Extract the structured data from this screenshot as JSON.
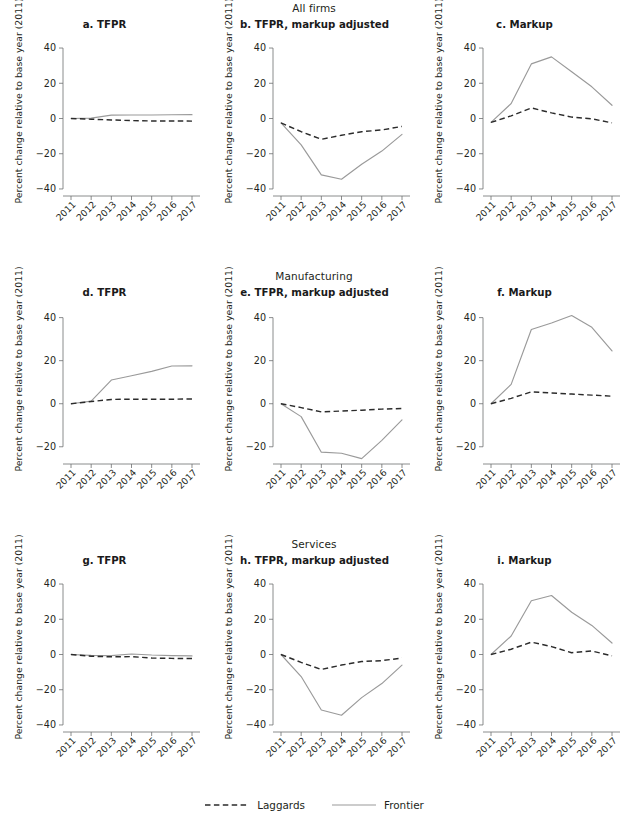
{
  "figure": {
    "row_labels": [
      "All firms",
      "Manufacturing",
      "Services"
    ],
    "ylabel": "Percent change relative to base year (2011)",
    "legend": [
      {
        "label": "Laggards",
        "style": "dashed",
        "color": "#2b2b2b"
      },
      {
        "label": "Frontier",
        "style": "solid",
        "color": "#9a9a9a"
      }
    ]
  },
  "chart_data": [
    {
      "type": "line",
      "panel": "a",
      "title": "a. TFPR",
      "group": "All firms",
      "xlabel": "",
      "ylabel": "Percent change relative to base year (2011)",
      "x": [
        "2011",
        "2012",
        "2013",
        "2014",
        "2015",
        "2016",
        "2017"
      ],
      "yticks": [
        40,
        20,
        0,
        -20,
        -40
      ],
      "ylim": [
        -44,
        44
      ],
      "grid": false,
      "series": [
        {
          "name": "Laggards",
          "values": [
            0.0,
            -0.4,
            -0.8,
            -1.2,
            -1.4,
            -1.4,
            -1.5
          ]
        },
        {
          "name": "Frontier",
          "values": [
            0.0,
            0.2,
            1.9,
            2.0,
            2.0,
            2.1,
            2.2
          ]
        }
      ]
    },
    {
      "type": "line",
      "panel": "b",
      "title": "b. TFPR, markup adjusted",
      "group": "All firms",
      "xlabel": "",
      "ylabel": "Percent change relative to base year (2011)",
      "x": [
        "2011",
        "2012",
        "2013",
        "2014",
        "2015",
        "2016",
        "2017"
      ],
      "yticks": [
        40,
        20,
        0,
        -20,
        -40
      ],
      "ylim": [
        -44,
        44
      ],
      "grid": false,
      "series": [
        {
          "name": "Laggards",
          "values": [
            -2.5,
            -7.5,
            -11.8,
            -9.5,
            -7.5,
            -6.5,
            -4.5
          ]
        },
        {
          "name": "Frontier",
          "values": [
            -2.5,
            -15.0,
            -32.0,
            -34.5,
            -26.0,
            -18.5,
            -9.0
          ]
        }
      ]
    },
    {
      "type": "line",
      "panel": "c",
      "title": "c. Markup",
      "group": "All firms",
      "xlabel": "",
      "ylabel": "Percent change relative to base year (2011)",
      "x": [
        "2011",
        "2012",
        "2013",
        "2014",
        "2015",
        "2016",
        "2017"
      ],
      "yticks": [
        40,
        20,
        0,
        -20,
        -40
      ],
      "ylim": [
        -44,
        44
      ],
      "grid": false,
      "series": [
        {
          "name": "Laggards",
          "values": [
            -2.2,
            1.5,
            6.0,
            3.2,
            0.8,
            -0.2,
            -2.5
          ]
        },
        {
          "name": "Frontier",
          "values": [
            -2.2,
            8.5,
            31.0,
            35.0,
            26.5,
            18.0,
            7.5
          ]
        }
      ]
    },
    {
      "type": "line",
      "panel": "d",
      "title": "d. TFPR",
      "group": "Manufacturing",
      "xlabel": "",
      "ylabel": "Percent change relative to base year (2011)",
      "x": [
        "2011",
        "2012",
        "2013",
        "2014",
        "2015",
        "2016",
        "2017"
      ],
      "yticks": [
        40,
        20,
        0,
        -20
      ],
      "ylim": [
        -28,
        44
      ],
      "grid": false,
      "series": [
        {
          "name": "Laggards",
          "values": [
            0.0,
            1.0,
            2.0,
            2.1,
            2.1,
            2.1,
            2.2
          ]
        },
        {
          "name": "Frontier",
          "values": [
            0.0,
            1.2,
            11.0,
            13.0,
            15.0,
            17.5,
            17.6
          ]
        }
      ]
    },
    {
      "type": "line",
      "panel": "e",
      "title": "e. TFPR, markup adjusted",
      "group": "Manufacturing",
      "xlabel": "",
      "ylabel": "Percent change relative to base year (2011)",
      "x": [
        "2011",
        "2012",
        "2013",
        "2014",
        "2015",
        "2016",
        "2017"
      ],
      "yticks": [
        40,
        20,
        0,
        -20
      ],
      "ylim": [
        -28,
        44
      ],
      "grid": false,
      "series": [
        {
          "name": "Laggards",
          "values": [
            0.0,
            -1.8,
            -3.8,
            -3.4,
            -3.0,
            -2.5,
            -2.2
          ]
        },
        {
          "name": "Frontier",
          "values": [
            0.0,
            -6.0,
            -22.5,
            -23.0,
            -25.5,
            -17.0,
            -7.5
          ]
        }
      ]
    },
    {
      "type": "line",
      "panel": "f",
      "title": "f. Markup",
      "group": "Manufacturing",
      "xlabel": "",
      "ylabel": "Percent change relative to base year (2011)",
      "x": [
        "2011",
        "2012",
        "2013",
        "2014",
        "2015",
        "2016",
        "2017"
      ],
      "yticks": [
        40,
        20,
        0,
        -20
      ],
      "ylim": [
        -28,
        44
      ],
      "grid": false,
      "series": [
        {
          "name": "Laggards",
          "values": [
            0.0,
            2.5,
            5.5,
            5.0,
            4.5,
            4.0,
            3.5
          ]
        },
        {
          "name": "Frontier",
          "values": [
            0.0,
            9.0,
            34.5,
            37.5,
            41.0,
            35.5,
            24.5
          ]
        }
      ]
    },
    {
      "type": "line",
      "panel": "g",
      "title": "g. TFPR",
      "group": "Services",
      "xlabel": "",
      "ylabel": "Percent change relative to base year (2011)",
      "x": [
        "2011",
        "2012",
        "2013",
        "2014",
        "2015",
        "2016",
        "2017"
      ],
      "yticks": [
        40,
        20,
        0,
        -20,
        -40
      ],
      "ylim": [
        -44,
        44
      ],
      "grid": false,
      "series": [
        {
          "name": "Laggards",
          "values": [
            0.0,
            -1.0,
            -1.3,
            -1.2,
            -2.0,
            -2.2,
            -2.3
          ]
        },
        {
          "name": "Frontier",
          "values": [
            0.0,
            -0.5,
            -0.6,
            0.3,
            -0.3,
            -0.6,
            -0.8
          ]
        }
      ]
    },
    {
      "type": "line",
      "panel": "h",
      "title": "h. TFPR, markup adjusted",
      "group": "Services",
      "xlabel": "",
      "ylabel": "Percent change relative to base year (2011)",
      "x": [
        "2011",
        "2012",
        "2013",
        "2014",
        "2015",
        "2016",
        "2017"
      ],
      "yticks": [
        40,
        20,
        0,
        -20,
        -40
      ],
      "ylim": [
        -44,
        44
      ],
      "grid": false,
      "series": [
        {
          "name": "Laggards",
          "values": [
            0.0,
            -4.5,
            -8.5,
            -6.0,
            -4.0,
            -3.5,
            -2.0
          ]
        },
        {
          "name": "Frontier",
          "values": [
            0.0,
            -12.5,
            -31.5,
            -34.5,
            -24.5,
            -16.5,
            -6.0
          ]
        }
      ]
    },
    {
      "type": "line",
      "panel": "i",
      "title": "i. Markup",
      "group": "Services",
      "xlabel": "",
      "ylabel": "Percent change relative to base year (2011)",
      "x": [
        "2011",
        "2012",
        "2013",
        "2014",
        "2015",
        "2016",
        "2017"
      ],
      "yticks": [
        40,
        20,
        0,
        -20,
        -40
      ],
      "ylim": [
        -44,
        44
      ],
      "grid": false,
      "series": [
        {
          "name": "Laggards",
          "values": [
            0.0,
            3.0,
            7.0,
            4.5,
            1.0,
            2.0,
            -0.8
          ]
        },
        {
          "name": "Frontier",
          "values": [
            0.0,
            10.5,
            30.5,
            33.5,
            24.0,
            16.5,
            6.5
          ]
        }
      ]
    }
  ]
}
